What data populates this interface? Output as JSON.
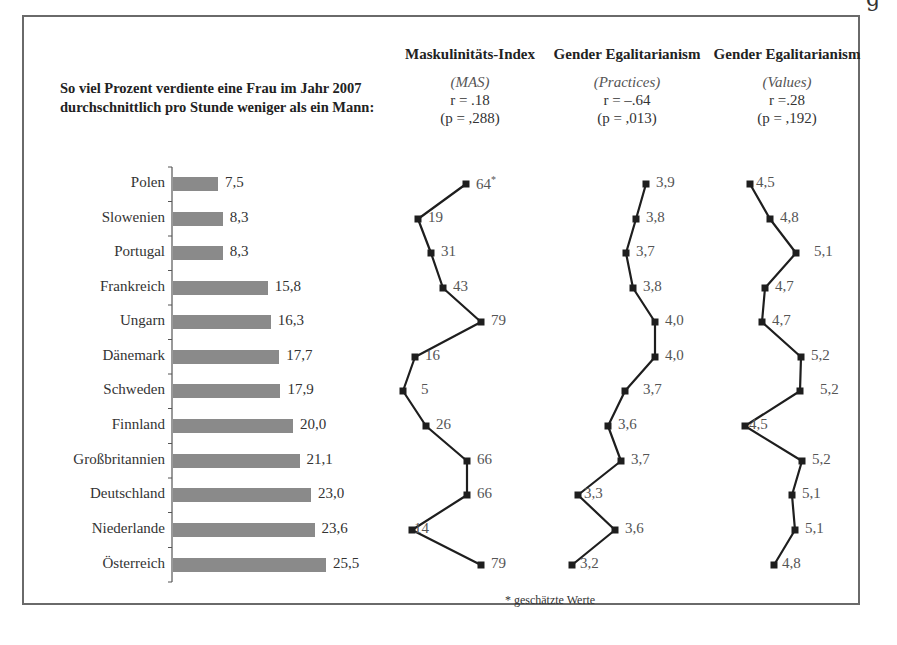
{
  "page": {
    "corner_glyph": "g",
    "headline": "So viel Prozent verdiente eine Frau im Jahr 2007 durchschnittlich pro Stunde weniger als ein Mann:",
    "footnote": "* geschätzte Werte"
  },
  "columns": [
    {
      "title": "Maskulinitäts-Index",
      "subtitle": "(MAS)",
      "r": "r = .18",
      "p": "(p = ,288)"
    },
    {
      "title": "Gender Egalitarianism",
      "subtitle": "(Practices)",
      "r": "r = –.64",
      "p": "(p = ,013)"
    },
    {
      "title": "Gender Egalitarianism",
      "subtitle": "(Values)",
      "r": "r =.28",
      "p": "(p = ,192)"
    }
  ],
  "colors": {
    "bar": "#8a8a8a",
    "line": "#1e1e1e",
    "marker": "#1e1e1e",
    "frame": "#6a6a6a",
    "text": "#333333"
  },
  "chart_data": [
    {
      "type": "bar",
      "orientation": "horizontal",
      "title": "So viel Prozent verdiente eine Frau im Jahr 2007 durchschnittlich pro Stunde weniger als ein Mann:",
      "categories": [
        "Polen",
        "Slowenien",
        "Portugal",
        "Frankreich",
        "Ungarn",
        "Dänemark",
        "Schweden",
        "Finnland",
        "Großbritannien",
        "Deutschland",
        "Niederlande",
        "Österreich"
      ],
      "values": [
        7.5,
        8.3,
        8.3,
        15.8,
        16.3,
        17.7,
        17.9,
        20.0,
        21.1,
        23.0,
        23.6,
        25.5
      ],
      "value_labels": [
        "7,5",
        "8,3",
        "8,3",
        "15,8",
        "16,3",
        "17,7",
        "17,9",
        "20,0",
        "21,1",
        "23,0",
        "23,6",
        "25,5"
      ],
      "xlabel": "",
      "ylabel": "",
      "grid": false
    },
    {
      "type": "line",
      "orientation": "vertical-profile",
      "title": "Maskulinitäts-Index (MAS)",
      "annotation": "r = .18 (p = ,288)",
      "categories": [
        "Polen",
        "Slowenien",
        "Portugal",
        "Frankreich",
        "Ungarn",
        "Dänemark",
        "Schweden",
        "Finnland",
        "Großbritannien",
        "Deutschland",
        "Niederlande",
        "Österreich"
      ],
      "values": [
        64,
        19,
        31,
        43,
        79,
        16,
        5,
        26,
        66,
        66,
        14,
        79
      ],
      "value_labels": [
        "64*",
        "19",
        "31",
        "43",
        "79",
        "16",
        "5",
        "26",
        "66",
        "66",
        "14",
        "79"
      ],
      "notes": "* geschätzte Werte"
    },
    {
      "type": "line",
      "orientation": "vertical-profile",
      "title": "Gender Egalitarianism (Practices)",
      "annotation": "r = –.64 (p = ,013)",
      "categories": [
        "Polen",
        "Slowenien",
        "Portugal",
        "Frankreich",
        "Ungarn",
        "Dänemark",
        "Schweden",
        "Finnland",
        "Großbritannien",
        "Deutschland",
        "Niederlande",
        "Österreich"
      ],
      "values": [
        3.9,
        3.8,
        3.7,
        3.8,
        4.0,
        4.0,
        3.7,
        3.6,
        3.7,
        3.3,
        3.6,
        3.2
      ],
      "value_labels": [
        "3,9",
        "3,8",
        "3,7",
        "3,8",
        "4,0",
        "4,0",
        "3,7",
        "3,6",
        "3,7",
        "3,3",
        "3,6",
        "3,2"
      ]
    },
    {
      "type": "line",
      "orientation": "vertical-profile",
      "title": "Gender Egalitarianism (Values)",
      "annotation": "r =.28 (p = ,192)",
      "categories": [
        "Polen",
        "Slowenien",
        "Portugal",
        "Frankreich",
        "Ungarn",
        "Dänemark",
        "Schweden",
        "Finnland",
        "Großbritannien",
        "Deutschland",
        "Niederlande",
        "Österreich"
      ],
      "values": [
        4.5,
        4.8,
        5.1,
        4.7,
        4.7,
        5.2,
        5.2,
        4.5,
        5.2,
        5.1,
        5.1,
        4.8
      ],
      "value_labels": [
        "4,5",
        "4,8",
        "5,1",
        "4,7",
        "4,7",
        "5,2",
        "5,2",
        "4,5",
        "5,2",
        "5,1",
        "5,1",
        "4,8"
      ]
    }
  ],
  "layout": {
    "row_y": [
      184,
      219,
      253,
      288,
      322,
      357,
      391,
      426,
      461,
      495,
      530,
      565
    ],
    "bar_x0": 173,
    "bar_px_per_unit": 6.0,
    "mas_x": [
      466,
      418,
      431,
      443,
      481,
      415,
      403,
      426,
      467,
      467,
      412,
      481
    ],
    "prac_x": [
      646,
      636,
      626,
      633,
      655,
      655,
      625,
      608,
      621,
      578,
      615,
      572
    ],
    "val_x": [
      750,
      770,
      796,
      765,
      762,
      801,
      800,
      745,
      802,
      792,
      795,
      774
    ],
    "mas_label_dx": [
      10,
      10,
      10,
      10,
      10,
      10,
      18,
      10,
      10,
      10,
      2,
      10
    ],
    "prac_label_dx": [
      10,
      10,
      10,
      10,
      10,
      10,
      18,
      10,
      10,
      6,
      10,
      8
    ],
    "val_label_dx": [
      6,
      10,
      18,
      10,
      10,
      10,
      20,
      4,
      10,
      10,
      10,
      8
    ]
  }
}
